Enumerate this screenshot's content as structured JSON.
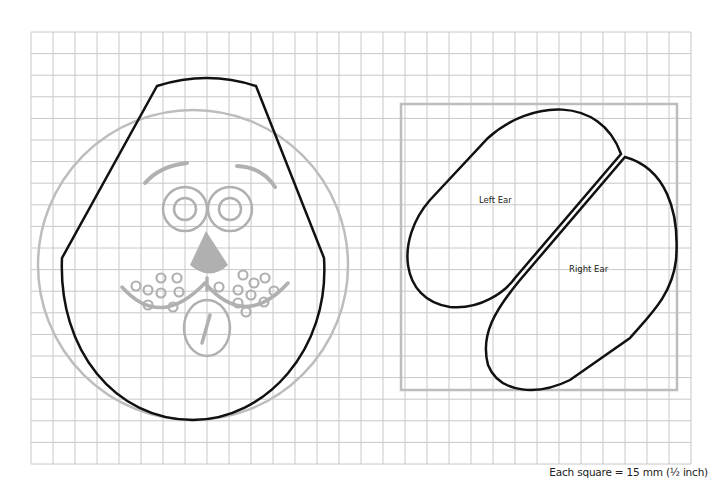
{
  "pattern": {
    "caption": "Each square = 15 mm (½ inch)",
    "grid": {
      "columns": 30,
      "rows": 20,
      "line_color": "#c8c8c8"
    },
    "pieces": [
      {
        "id": "head",
        "label": ""
      },
      {
        "id": "left-ear",
        "label": "Left Ear"
      },
      {
        "id": "right-ear",
        "label": "Right Ear"
      }
    ],
    "colors": {
      "outline": "#111111",
      "guide": "#bdbdbd",
      "face": "#b0b0b0"
    }
  }
}
